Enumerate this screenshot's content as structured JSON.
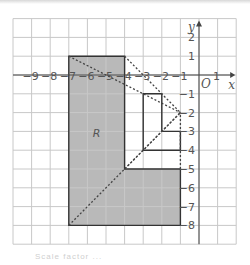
{
  "diagram": {
    "type": "coordinate-grid-enlargement",
    "origin_label": "O",
    "x_axis_label": "x",
    "y_axis_label": "y",
    "x_tick_labels": [
      "−9",
      "−8",
      "−7",
      "−6",
      "−5",
      "−4",
      "−3",
      "−2",
      "−1",
      "1"
    ],
    "y_tick_labels": [
      "2",
      "1",
      "−1",
      "−2",
      "−3",
      "−4",
      "−5",
      "−6",
      "−7",
      "−8"
    ],
    "x_range": [
      -10,
      2
    ],
    "y_range": [
      -9,
      3
    ],
    "shape_R": {
      "label": "R",
      "vertices": [
        [
          -7,
          1
        ],
        [
          -4,
          1
        ],
        [
          -4,
          -5
        ],
        [
          -1,
          -5
        ],
        [
          -1,
          -8
        ],
        [
          -7,
          -8
        ]
      ],
      "fill": "#b9b9b9"
    },
    "image_shape": {
      "vertices": [
        [
          -3,
          -1
        ],
        [
          -2,
          -1
        ],
        [
          -2,
          -3
        ],
        [
          -1,
          -3
        ],
        [
          -1,
          -4
        ],
        [
          -3,
          -4
        ]
      ],
      "fill": "none"
    },
    "centre_of_enlargement": [
      -1,
      -2
    ],
    "construction_lines": [
      [
        [
          -7,
          1
        ],
        [
          -1,
          -2
        ]
      ],
      [
        [
          -4,
          1
        ],
        [
          -1,
          -2
        ]
      ],
      [
        [
          -4,
          -5
        ],
        [
          -1,
          -2
        ]
      ],
      [
        [
          -7,
          -8
        ],
        [
          -1,
          -2
        ]
      ],
      [
        [
          -1,
          -5
        ],
        [
          -1,
          -2
        ]
      ]
    ],
    "colors": {
      "grid": "#c8c8c8",
      "axes": "#444444",
      "shape_outline": "#333333",
      "dashed": "#444444"
    }
  },
  "caption": "Scale factor ..."
}
